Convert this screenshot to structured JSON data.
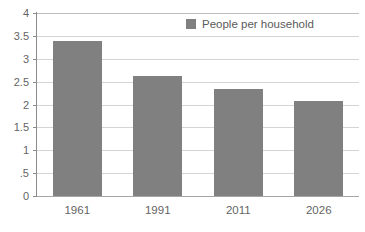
{
  "chart_data": {
    "type": "bar",
    "title": "",
    "subtitle": "",
    "xlabel": "",
    "ylabel": "",
    "categories": [
      "1961",
      "1991",
      "2011",
      "2026"
    ],
    "values": [
      3.38,
      2.62,
      2.35,
      2.07
    ],
    "series": [
      {
        "name": "People per household",
        "values": [
          3.38,
          2.62,
          2.35,
          2.07
        ],
        "color": "#808080"
      }
    ],
    "ylim": [
      0,
      4
    ],
    "ytick_values": [
      4,
      3.5,
      3,
      2.5,
      2,
      1.5,
      1,
      0.5,
      0
    ],
    "ytick_labels": [
      "4",
      "3.5",
      "3",
      "2.5",
      "2",
      "1.5",
      "1",
      ".5",
      "0"
    ],
    "grid": true,
    "grid_axis": "y",
    "legend": {
      "position": "top-center",
      "entries": [
        {
          "label": "People per household",
          "color": "#808080"
        }
      ]
    },
    "colors": {
      "bar": "#808080",
      "gridline": "#d4d4d4",
      "axis": "#8c8c8c",
      "baseline": "#a6a6a6",
      "text": "#646464",
      "background": "#ffffff"
    }
  }
}
